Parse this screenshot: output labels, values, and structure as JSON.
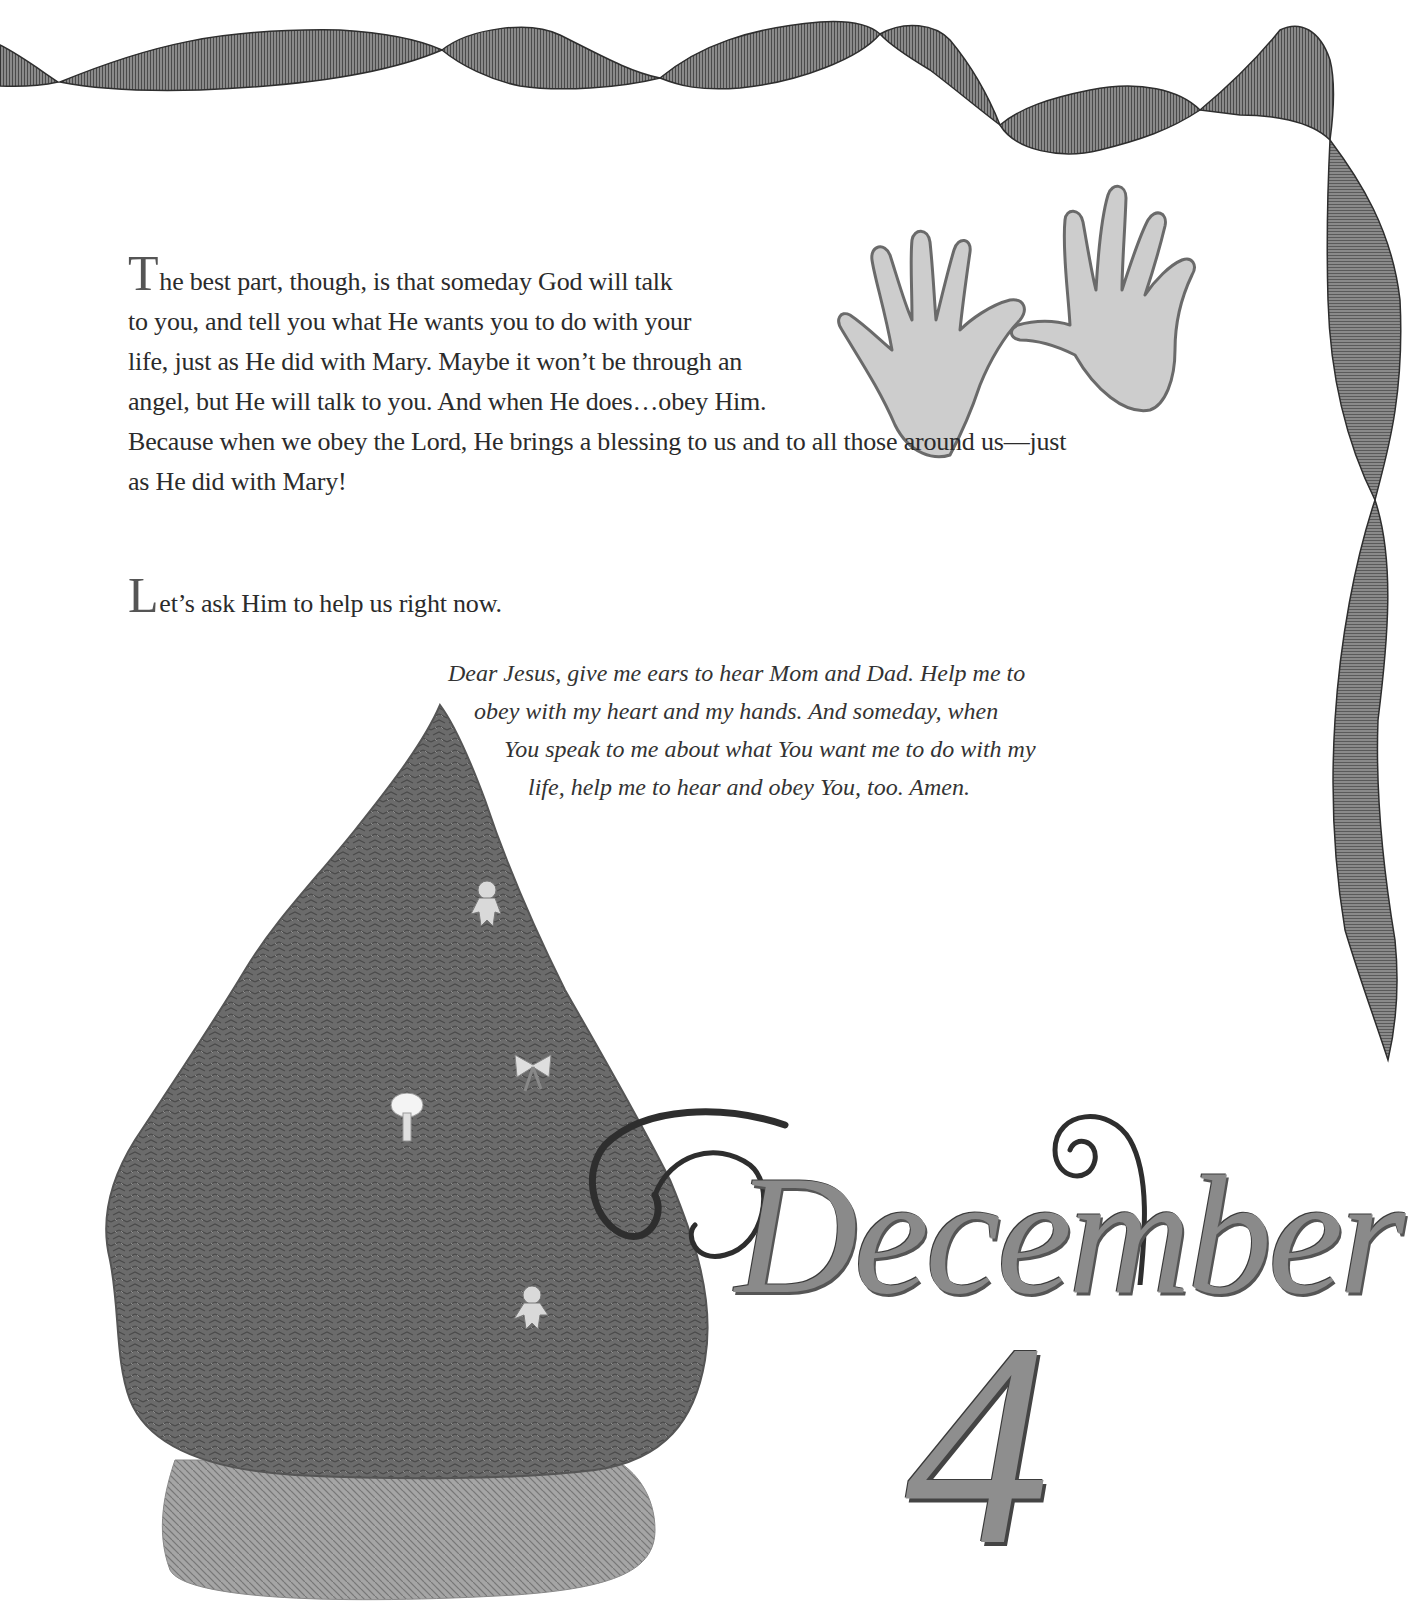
{
  "page": {
    "paragraph1": {
      "drop_cap": "T",
      "lines": [
        "he best part, though, is that someday God will talk",
        "to you, and tell you what He wants you to do with your",
        "life, just as He did with Mary. Maybe it won’t be through an",
        "angel, but He will talk to you. And when He does…obey Him.",
        "Because when we obey the Lord, He brings a blessing to us and to all those around us—just",
        "as He did with Mary!"
      ]
    },
    "paragraph2": {
      "drop_cap": "L",
      "text": "et’s ask Him to help us right now."
    },
    "prayer": {
      "lines": [
        "Dear Jesus, give me ears to hear Mom and Dad. Help me to",
        "obey with my heart and my hands. And someday, when",
        "You speak to me about what You want me to do with my",
        "life, help me to hear and obey You, too. Amen."
      ]
    },
    "date_heading": {
      "month": "December",
      "day": "4"
    }
  },
  "illustrations": {
    "ribbon": "ribbon-border",
    "hands": "handprints",
    "tree": "christmas-tree-with-gingerbread-ornaments"
  },
  "colors": {
    "ribbon": "#6e6e6e",
    "tree": "#6a6a6a",
    "tree_skirt": "#9a9a9a",
    "hands": "#c8c8c8",
    "text": "#2b2b2b"
  }
}
